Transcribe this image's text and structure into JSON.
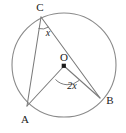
{
  "figure": {
    "type": "circle-geometry-diagram",
    "background_color": "#ffffff",
    "stroke_color": "#7a7a7a",
    "text_color": "#1a1a1a"
  },
  "circle": {
    "center_label": "O",
    "center_x": 64,
    "center_y": 65,
    "radius": 52
  },
  "points": [
    {
      "id": "C",
      "label": "C",
      "x": 41,
      "y": 17,
      "label_x": 40,
      "label_y": 11
    },
    {
      "id": "A",
      "label": "A",
      "x": 27,
      "y": 106,
      "label_x": 25,
      "label_y": 123
    },
    {
      "id": "B",
      "label": "B",
      "x": 100,
      "y": 98,
      "label_x": 110,
      "label_y": 104
    },
    {
      "id": "O",
      "label": "O",
      "x": 64,
      "y": 66,
      "label_x": 64,
      "label_y": 61
    }
  ],
  "segments": [
    {
      "id": "CA",
      "from": "C",
      "to": "A",
      "kind": "chord"
    },
    {
      "id": "CB",
      "from": "C",
      "to": "B",
      "kind": "chord"
    },
    {
      "id": "OA",
      "from": "O",
      "to": "A",
      "kind": "radius"
    },
    {
      "id": "OB",
      "from": "O",
      "to": "B",
      "kind": "radius"
    }
  ],
  "angles": [
    {
      "id": "inscribed-angle-C",
      "vertex": "C",
      "label": "x",
      "label_x": 48,
      "label_y": 36,
      "arc_path": "M 38.5 28.5 A 12 12 0 0 0 48.5 27.0"
    },
    {
      "id": "central-angle-O",
      "vertex": "O",
      "label": "2x",
      "label_x": 72,
      "label_y": 89,
      "arc_path": "M 55.5 79.5 A 17 17 0 0 0 79.0 80.5"
    }
  ]
}
